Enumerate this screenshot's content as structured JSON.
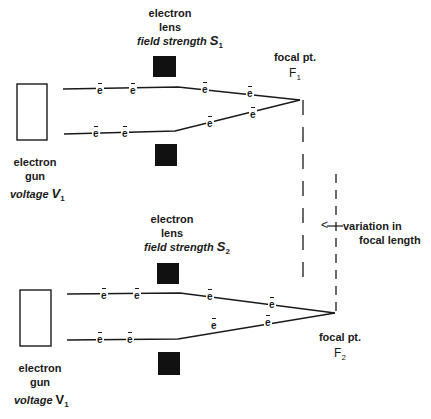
{
  "diagram": {
    "top_setup": {
      "lens_label": [
        "electron",
        "lens"
      ],
      "lens_field_prefix": "field strength ",
      "lens_field_symbol": "S",
      "lens_field_subscript": "1",
      "gun_label": [
        "electron",
        "gun"
      ],
      "gun_voltage_prefix": "voltage ",
      "gun_voltage_symbol": "V",
      "gun_voltage_subscript": "1",
      "focal_label": "focal pt.",
      "focal_symbol": "F",
      "focal_subscript": "1"
    },
    "bottom_setup": {
      "lens_label": [
        "electron",
        "lens"
      ],
      "lens_field_prefix": "field strength ",
      "lens_field_symbol": "S",
      "lens_field_subscript": "2",
      "gun_label": [
        "electron",
        "gun"
      ],
      "gun_voltage_prefix": "voltage ",
      "gun_voltage_symbol": "V",
      "gun_voltage_subscript": "1",
      "focal_label": "focal pt.",
      "focal_symbol": "F",
      "focal_subscript": "2"
    },
    "electron_symbol": "e",
    "variation_label": [
      "variation in",
      "focal length"
    ],
    "arrow_glyph": "<",
    "colors": {
      "ink": "#1a1a1a",
      "background": "#ffffff"
    }
  }
}
